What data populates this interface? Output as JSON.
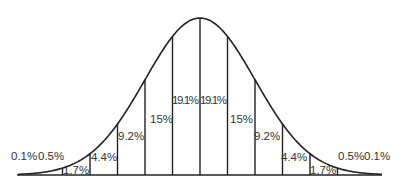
{
  "chart_data": {
    "type": "area",
    "title": "",
    "xlabel": "",
    "ylabel": "",
    "categories": [
      "-3σ to -2.5σ",
      "-2.5σ to -2σ",
      "-2σ to -1.5σ",
      "-1.5σ to -1σ",
      "-1σ to -0.5σ",
      "-0.5σ to 0",
      "0 to 0.5σ",
      "0.5σ to 1σ",
      "1σ to 1.5σ",
      "1.5σ to 2σ",
      "2σ to 2.5σ",
      "2.5σ to 3σ"
    ],
    "values": [
      0.5,
      1.7,
      4.4,
      9.2,
      15,
      19.1,
      19.1,
      15,
      9.2,
      4.4,
      1.7,
      0.5
    ],
    "tails": {
      "left": 0.1,
      "right": 0.1
    },
    "labels": [
      "0.1%",
      "0.5%",
      "1.7%",
      "4.4%",
      "9.2%",
      "15%",
      "19.1%",
      "19.1%",
      "15%",
      "9.2%",
      "4.4%",
      "1.7%",
      "0.5%",
      "0.1%"
    ],
    "grid": false,
    "legend": null,
    "colors": {
      "line": "#222222",
      "text": "#333333",
      "background": "#ffffff"
    }
  },
  "labels": {
    "left_tail": "0.1%",
    "l1": "0.5%",
    "l2": "1.7%",
    "l3": "4.4%",
    "l4": "9.2%",
    "l5": "15%",
    "l6": "19.1%",
    "r6": "19.1%",
    "r5": "15%",
    "r4": "9.2%",
    "r3": "4.4%",
    "r2": "1.7%",
    "r1": "0.5%",
    "right_tail": "0.1%"
  }
}
